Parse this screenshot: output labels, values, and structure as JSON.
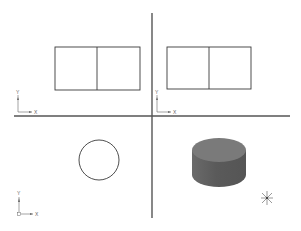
{
  "drawing": {
    "type": "CAD multi-view orthographic projection",
    "colors": {
      "background": "#ffffff",
      "line": "#3a3a3a",
      "divider": "#555555",
      "ucs_icon": "#666666",
      "cylinder_top": "#7a7a7a",
      "cylinder_side": "#5f5f5f"
    },
    "dividers": {
      "horizontal": {
        "x1": 14,
        "x2": 290,
        "y": 116
      },
      "vertical": {
        "x": 152,
        "y1": 13,
        "y2": 218
      }
    },
    "viewports": [
      {
        "name": "front-view",
        "position": "top-left",
        "shape": "rectangle-split",
        "rect": {
          "x": 55,
          "y": 47,
          "w": 85,
          "h": 43
        },
        "split_x": 97,
        "ucs": {
          "origin_x": 18,
          "origin_y": 112,
          "x_label": "X",
          "y_label": "Y",
          "origin_box": false
        }
      },
      {
        "name": "side-view",
        "position": "top-right",
        "shape": "rectangle-split",
        "rect": {
          "x": 167,
          "y": 47,
          "w": 84,
          "h": 42
        },
        "split_x": 209,
        "ucs": {
          "origin_x": 157,
          "origin_y": 112,
          "x_label": "X",
          "y_label": "Y",
          "origin_box": false
        }
      },
      {
        "name": "top-view",
        "position": "bottom-left",
        "shape": "circle",
        "circle": {
          "cx": 99,
          "cy": 160,
          "r": 20
        },
        "ucs": {
          "origin_x": 19,
          "origin_y": 213,
          "x_label": "X",
          "y_label": "Y",
          "origin_box": true
        }
      },
      {
        "name": "isometric-view",
        "position": "bottom-right",
        "shape": "shaded-cylinder",
        "cylinder": {
          "cx": 219,
          "top_cy": 150,
          "rx": 27,
          "ry": 12,
          "height": 25
        },
        "perspective_icon": {
          "cx": 267,
          "cy": 198,
          "size": 12
        }
      }
    ]
  }
}
